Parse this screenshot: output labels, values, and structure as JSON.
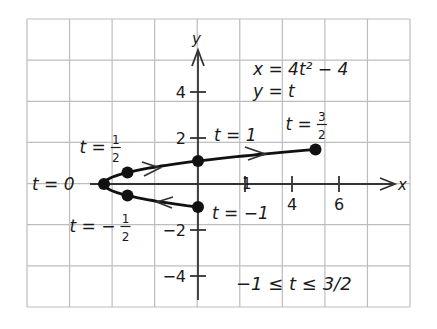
{
  "chart_data": {
    "type": "line",
    "title": "",
    "xlabel": "x",
    "ylabel": "y",
    "xlim": [
      -7.5,
      9
    ],
    "ylim": [
      -5,
      6
    ],
    "grid": true,
    "equations": [
      "x = 4t² − 4",
      "y = t"
    ],
    "parameter_range": "−1 ≤ t ≤ 3/2",
    "x_ticks": [
      {
        "value": 2,
        "label": "1"
      },
      {
        "value": 4,
        "label": "4"
      },
      {
        "value": 6,
        "label": "6"
      }
    ],
    "y_ticks": [
      {
        "value": 4,
        "label": "4"
      },
      {
        "value": 2,
        "label": "2"
      },
      {
        "value": -2,
        "label": "−2"
      },
      {
        "value": -4,
        "label": "−4"
      }
    ],
    "series": [
      {
        "name": "parametric curve",
        "t": [
          -1,
          -0.5,
          0,
          0.5,
          1,
          1.5
        ],
        "x": [
          0,
          -3,
          -4,
          -3,
          0,
          5
        ],
        "y": [
          -1,
          -0.5,
          0,
          0.5,
          1,
          1.5
        ]
      }
    ],
    "points": [
      {
        "t": 0,
        "x": -4,
        "y": 0,
        "label": "t = 0"
      },
      {
        "t": 0.5,
        "x": -3,
        "y": 0.5,
        "label_prefix": "t =",
        "num": "1",
        "den": "2"
      },
      {
        "t": -0.5,
        "x": -3,
        "y": -0.5,
        "label_prefix": "t = −",
        "num": "1",
        "den": "2"
      },
      {
        "t": 1,
        "x": 0,
        "y": 1,
        "label": "t = 1"
      },
      {
        "t": -1,
        "x": 0,
        "y": -1,
        "label": "t = −1"
      },
      {
        "t": 1.5,
        "x": 5,
        "y": 1.5,
        "label_prefix": "t =",
        "num": "3",
        "den": "2"
      }
    ],
    "direction": "increasing t: from (0,-1) through (-4,0) to (5,1.5)"
  }
}
